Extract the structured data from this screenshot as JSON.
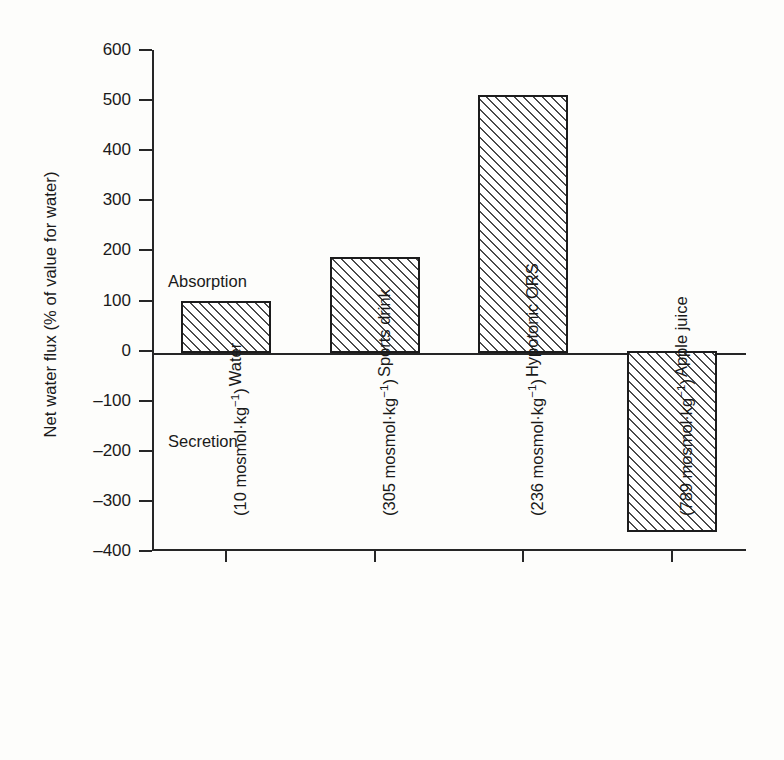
{
  "chart_data": {
    "type": "bar",
    "title": "",
    "xlabel": "",
    "ylabel": "Net water flux (% of value for water)",
    "ylim": [
      -400,
      600
    ],
    "ytick_step": 100,
    "grid": false,
    "legend": "none",
    "zero_line": 0,
    "categories": [
      "Water (10 mosmol·kg⁻¹)",
      "Sports drink (305 mosmol·kg⁻¹)",
      "Hypotonic ORS (236 mosmol·kg⁻¹)",
      "Apple juice (789 mosmol·kg⁻¹)"
    ],
    "values": [
      100,
      186,
      510,
      -363
    ],
    "annotations": [
      "Absorption",
      "Secretion"
    ],
    "bar_style": "diagonal-hatch"
  },
  "axis": {
    "y_title": "Net water flux (% of value for water)",
    "y_ticks": [
      {
        "label": "600",
        "value": 600
      },
      {
        "label": "500",
        "value": 500
      },
      {
        "label": "400",
        "value": 400
      },
      {
        "label": "300",
        "value": 300
      },
      {
        "label": "200",
        "value": 200
      },
      {
        "label": "100",
        "value": 100
      },
      {
        "label": "0",
        "value": 0
      },
      {
        "label": "–100",
        "value": -100
      },
      {
        "label": "–200",
        "value": -200
      },
      {
        "label": "–300",
        "value": -300
      },
      {
        "label": "–400",
        "value": -400
      }
    ]
  },
  "regions": {
    "absorption": "Absorption",
    "secretion": "Secretion"
  },
  "bars": [
    {
      "name": "water",
      "value": 100,
      "line1": "Water",
      "line2_prefix": "(10 mosmol·kg",
      "line2_sup": "−1",
      "line2_suffix": ")"
    },
    {
      "name": "sports-drink",
      "value": 186,
      "line1": "Sports drink",
      "line2_prefix": "(305 mosmol·kg",
      "line2_sup": "−1",
      "line2_suffix": ")"
    },
    {
      "name": "hypotonic-ors",
      "value": 510,
      "line1": "Hypotonic ORS",
      "line2_prefix": "(236 mosmol·kg",
      "line2_sup": "−1",
      "line2_suffix": ")"
    },
    {
      "name": "apple-juice",
      "value": -363,
      "line1": "Apple juice",
      "line2_prefix": "(789 mosmol·kg",
      "line2_sup": "−1",
      "line2_suffix": ")"
    }
  ],
  "colors": {
    "ink": "#1a1a1a",
    "axis": "#262626",
    "hatch": "#4a4a4a",
    "background": "#fdfdfb"
  }
}
